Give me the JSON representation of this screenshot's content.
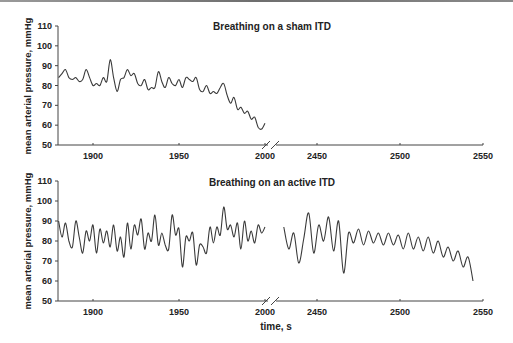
{
  "chart_data": [
    {
      "type": "line",
      "title": "Breathing on a sham ITD",
      "xlabel": "",
      "ylabel": "mean arterial pressure, mmHg",
      "ylim": [
        50,
        110
      ],
      "yticks": [
        50,
        60,
        70,
        80,
        90,
        100,
        110
      ],
      "xticks_left": [
        1900,
        1950,
        2000
      ],
      "xticks_right": [
        2450,
        2500,
        2550
      ],
      "axis_break": "between 2000 and 2450",
      "grid": false,
      "series": [
        {
          "name": "MAP sham",
          "x": [
            1880,
            1882,
            1884,
            1886,
            1888,
            1890,
            1892,
            1894,
            1896,
            1898,
            1900,
            1902,
            1904,
            1906,
            1908,
            1910,
            1912,
            1914,
            1916,
            1918,
            1920,
            1922,
            1924,
            1926,
            1928,
            1930,
            1932,
            1934,
            1936,
            1938,
            1940,
            1942,
            1944,
            1946,
            1948,
            1950,
            1952,
            1954,
            1956,
            1958,
            1960,
            1962,
            1964,
            1966,
            1968,
            1970,
            1972,
            1974,
            1976,
            1978,
            1980,
            1982,
            1984,
            1986,
            1988,
            1990,
            1992,
            1994,
            1996,
            1998,
            2000
          ],
          "values": [
            84,
            86,
            88,
            84,
            83,
            84,
            82,
            83,
            88,
            84,
            80,
            81,
            80,
            84,
            82,
            93,
            84,
            77,
            83,
            84,
            88,
            85,
            86,
            81,
            80,
            83,
            78,
            79,
            79,
            87,
            82,
            79,
            84,
            81,
            80,
            83,
            79,
            84,
            83,
            82,
            84,
            78,
            77,
            80,
            76,
            77,
            76,
            79,
            81,
            75,
            71,
            74,
            68,
            69,
            66,
            67,
            63,
            64,
            59,
            58,
            61
          ],
          "x_end_note": "trace ends near 2002 at ~61 mmHg"
        }
      ]
    },
    {
      "type": "line",
      "title": "Breathing on an active ITD",
      "xlabel": "time, s",
      "ylabel": "mean arterial pressure, mmHg",
      "ylim": [
        50,
        110
      ],
      "yticks": [
        50,
        60,
        70,
        80,
        90,
        100,
        110
      ],
      "xticks_left": [
        1900,
        1950,
        2000
      ],
      "xticks_right": [
        2450,
        2500,
        2550
      ],
      "axis_break": "between 2000 and 2450",
      "grid": false,
      "series": [
        {
          "name": "MAP active (segment 1)",
          "x": [
            1880,
            1882,
            1884,
            1886,
            1888,
            1890,
            1892,
            1894,
            1896,
            1898,
            1900,
            1902,
            1904,
            1906,
            1908,
            1910,
            1912,
            1914,
            1916,
            1918,
            1920,
            1922,
            1924,
            1926,
            1928,
            1930,
            1932,
            1934,
            1936,
            1938,
            1940,
            1942,
            1944,
            1946,
            1948,
            1950,
            1952,
            1954,
            1956,
            1958,
            1960,
            1962,
            1964,
            1966,
            1968,
            1970,
            1972,
            1974,
            1976,
            1978,
            1980,
            1982,
            1984,
            1986,
            1988,
            1990,
            1992,
            1994,
            1996,
            1998,
            2000
          ],
          "values": [
            90,
            82,
            89,
            80,
            77,
            90,
            82,
            74,
            85,
            80,
            88,
            74,
            86,
            79,
            85,
            77,
            88,
            75,
            82,
            72,
            89,
            76,
            88,
            83,
            91,
            76,
            84,
            80,
            93,
            78,
            84,
            78,
            76,
            93,
            83,
            86,
            67,
            82,
            80,
            84,
            68,
            78,
            77,
            74,
            87,
            79,
            87,
            83,
            97,
            86,
            88,
            82,
            89,
            76,
            90,
            80,
            85,
            79,
            88,
            84,
            87
          ],
          "x_end_note": "segment ends ~2002"
        },
        {
          "name": "MAP active (segment 2)",
          "x": [
            2430,
            2433,
            2436,
            2439,
            2442,
            2445,
            2448,
            2451,
            2454,
            2457,
            2460,
            2463,
            2466,
            2469,
            2472,
            2475,
            2478,
            2481,
            2484,
            2487,
            2490,
            2493,
            2496,
            2499,
            2502,
            2505,
            2508,
            2511,
            2514,
            2517,
            2520,
            2523,
            2526,
            2529,
            2532,
            2535,
            2538,
            2541,
            2544
          ],
          "values": [
            87,
            76,
            84,
            69,
            81,
            94,
            74,
            88,
            80,
            92,
            75,
            90,
            64,
            84,
            79,
            86,
            78,
            85,
            79,
            84,
            78,
            84,
            78,
            83,
            76,
            84,
            76,
            82,
            75,
            82,
            74,
            80,
            72,
            77,
            70,
            75,
            67,
            72,
            60
          ]
        }
      ]
    }
  ],
  "charts": {
    "top": {
      "title": "Breathing on a sham ITD",
      "ylabel": "mean arterial pressure, mmHg"
    },
    "bottom": {
      "title": "Breathing on an active ITD",
      "ylabel": "mean arterial pressure, mmHg",
      "xlabel": "time, s"
    },
    "yticks": [
      "50",
      "60",
      "70",
      "80",
      "90",
      "100",
      "110"
    ],
    "xticks": [
      "1900",
      "1950",
      "2000",
      "2450",
      "2500",
      "2550"
    ]
  }
}
